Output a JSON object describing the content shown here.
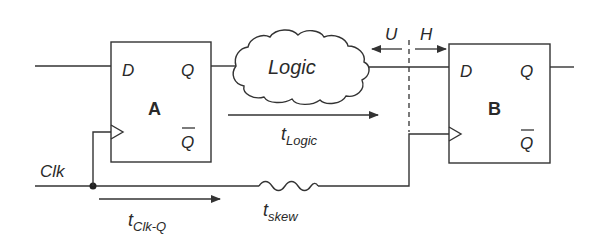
{
  "diagram": {
    "flipflop_a": {
      "name": "A",
      "d": "D",
      "q": "Q",
      "qbar": "Q"
    },
    "flipflop_b": {
      "name": "B",
      "d": "D",
      "q": "Q",
      "qbar": "Q"
    },
    "logic_cloud": {
      "label": "Logic"
    },
    "clock": {
      "label": "Clk"
    },
    "setup_label": "U",
    "hold_label": "H",
    "t_logic": {
      "base": "t",
      "sub": "Logic"
    },
    "t_clkq": {
      "base": "t",
      "sub": "Clk-Q"
    },
    "t_skew": {
      "base": "t",
      "sub": "skew"
    },
    "colors": {
      "ink": "#2a2a2a",
      "background": "#ffffff"
    }
  }
}
